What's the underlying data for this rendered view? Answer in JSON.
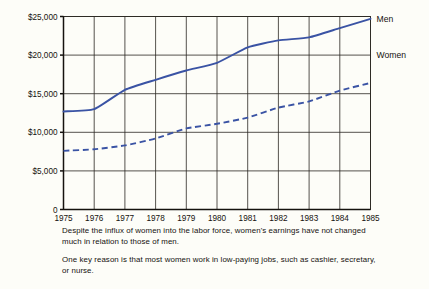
{
  "chart_data": {
    "type": "line",
    "title": "",
    "xlabel": "",
    "ylabel": "",
    "x": [
      1975,
      1976,
      1977,
      1978,
      1979,
      1980,
      1981,
      1982,
      1983,
      1984,
      1985
    ],
    "categories": [
      "1975",
      "1976",
      "1977",
      "1978",
      "1979",
      "1980",
      "1981",
      "1982",
      "1983",
      "1984",
      "1985"
    ],
    "xlim": [
      1975,
      1985
    ],
    "ylim": [
      0,
      25000
    ],
    "ytick_values": [
      0,
      5000,
      10000,
      15000,
      20000,
      25000
    ],
    "ytick_labels": [
      "0",
      "$5,000",
      "$10,000",
      "$15,000",
      "$20,000",
      "$25,000"
    ],
    "grid": true,
    "legend_position": "right-inline",
    "series": [
      {
        "name": "Men",
        "style": "solid",
        "color": "#3a53a4",
        "values": [
          12700,
          13000,
          15500,
          16800,
          18000,
          19000,
          21000,
          21900,
          22300,
          23500,
          24700
        ]
      },
      {
        "name": "Women",
        "style": "dashed",
        "color": "#3a53a4",
        "values": [
          7600,
          7800,
          8300,
          9200,
          10500,
          11100,
          11900,
          13200,
          14000,
          15400,
          16400
        ]
      }
    ]
  },
  "series_labels": {
    "men": "Men",
    "women": "Women"
  },
  "captions": [
    "Despite the influx of women into the labor force, women's earnings have not changed much in relation to those of men.",
    "One key reason is that most women work in low-paying jobs, such as cashier, secretary, or nurse."
  ],
  "colors": {
    "line": "#3a53a4",
    "axis": "#15120e",
    "grid": "#2b2722",
    "background": "#fdfdf8"
  }
}
